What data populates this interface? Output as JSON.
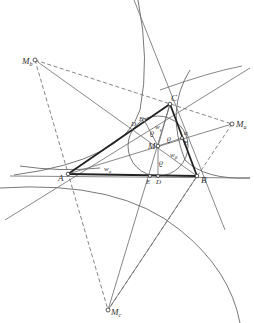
{
  "diagram": {
    "points": {
      "A": {
        "label": "A",
        "x": 68,
        "y": 174
      },
      "B": {
        "label": "B",
        "x": 197,
        "y": 176
      },
      "C": {
        "label": "C",
        "x": 170,
        "y": 104
      },
      "M": {
        "label": "M",
        "x": 158,
        "y": 146
      },
      "Ma": {
        "label": "M",
        "sub": "a",
        "x": 232,
        "y": 124
      },
      "Mb": {
        "label": "M",
        "sub": "b",
        "x": 35,
        "y": 60
      },
      "Mc": {
        "label": "M",
        "sub": "c",
        "x": 108,
        "y": 310
      },
      "D": {
        "label": "D",
        "x": 158,
        "y": 176
      },
      "E": {
        "label": "E",
        "x": 182,
        "y": 138
      },
      "F": {
        "label": "F",
        "x": 144,
        "y": 120
      },
      "Dfoot": {
        "label": "D",
        "x": 132,
        "y": 126
      },
      "Efoot": {
        "label": "E",
        "x": 150,
        "y": 176
      }
    },
    "labels": {
      "rho1": "ϱ",
      "rho2": "ϱ",
      "rho3": "ϱ",
      "wa": "w",
      "wa_sub": "a",
      "wb": "w",
      "wb_sub": "β",
      "wg": "w",
      "wg_sub": "γ",
      "alpha": "α"
    }
  }
}
